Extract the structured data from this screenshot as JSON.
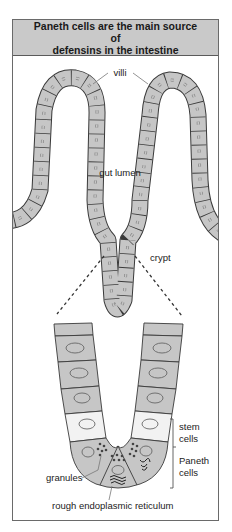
{
  "figure": {
    "title": "Paneth cells are the main source of defensins in the intestine",
    "title_lines": [
      "Paneth cells are the main source of",
      "defensins in the intestine"
    ]
  },
  "labels": {
    "villi": "villi",
    "gut_lumen": "gut lumen",
    "crypt": "crypt",
    "stem_cells_line1": "stem",
    "stem_cells_line2": "cells",
    "paneth_cells_line1": "Paneth",
    "paneth_cells_line2": "cells",
    "granules": "granules",
    "rough_er": "rough endoplasmic reticulum"
  },
  "colors": {
    "cell_fill": "#c6c6c6",
    "stem_cell_fill": "#f2f2f2",
    "header_fill": "#c9c9c9",
    "outline": "#3a3a3a"
  }
}
